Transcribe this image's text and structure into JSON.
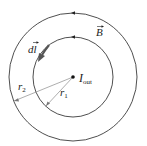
{
  "diagram": {
    "labels": {
      "current": "I",
      "current_sub": "out",
      "field": "B",
      "dl": "dl",
      "r1": "r",
      "r1_sub": "1",
      "r2": "r",
      "r2_sub": "2"
    },
    "colors": {
      "stroke": "#222222",
      "arrow": "#555555",
      "radius_line": "#777777",
      "background": "#ffffff"
    },
    "geometry": {
      "center": [
        73,
        77
      ],
      "outer_radius": 64,
      "inner_radius": 40
    }
  }
}
